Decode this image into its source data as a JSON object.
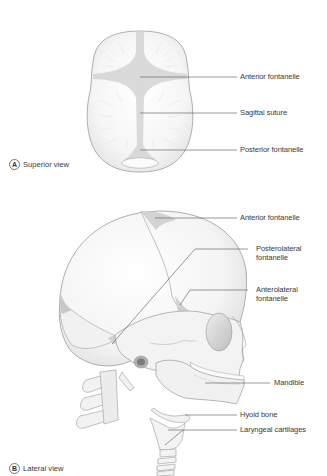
{
  "figure": {
    "panels": [
      {
        "letter": "A",
        "caption": "Superior view",
        "labels": [
          {
            "text": "Anterior fontanelle"
          },
          {
            "text": "Sagittal suture"
          },
          {
            "text": "Posterior fontanelle"
          }
        ]
      },
      {
        "letter": "B",
        "caption": "Lateral view",
        "labels": [
          {
            "text": "Anterior fontanelle"
          },
          {
            "text": "Posterolateral",
            "text2": "fontanelle"
          },
          {
            "text": "Anterolateral",
            "text2": "fontanelle"
          },
          {
            "text": "Mandible"
          },
          {
            "text": "Hyoid bone"
          },
          {
            "text": "Laryngeal cartilages"
          }
        ]
      }
    ],
    "colors": {
      "bone_fill": "#f4f4f4",
      "bone_outline": "#9a9a9a",
      "fontanelle_fill": "#cfcfcf",
      "leader_line": "#555555",
      "text": "#3a3a3a"
    }
  }
}
